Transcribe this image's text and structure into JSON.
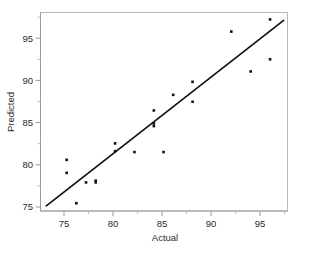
{
  "chart_data": {
    "type": "scatter",
    "title": "",
    "subtitle": "",
    "xlabel": "Actual",
    "ylabel": "Predicted",
    "xlim": [
      72.3,
      97.8
    ],
    "ylim": [
      74.4,
      97.3
    ],
    "xticks": [
      75,
      80,
      85,
      90,
      95
    ],
    "xtick_labels": [
      "75",
      "80",
      "85",
      "90",
      "95"
    ],
    "yticks": [
      75,
      80,
      85,
      90,
      95
    ],
    "ytick_labels": [
      "75",
      "80",
      "85",
      "90",
      "95"
    ],
    "grid": false,
    "legend": false,
    "legend_position": "none",
    "marker": "square",
    "marker_color": "#111111",
    "marker_size_px": 2.6,
    "series": [
      {
        "name": "Predicted vs Actual",
        "x": [
          75.0,
          75.0,
          76.0,
          77.0,
          78.0,
          78.0,
          80.0,
          80.0,
          82.0,
          84.0,
          84.0,
          84.0,
          85.0,
          86.0,
          88.0,
          88.0,
          92.0,
          94.0,
          96.0,
          96.0
        ],
        "y": [
          80.3,
          78.8,
          75.3,
          77.7,
          77.7,
          77.9,
          82.2,
          81.3,
          81.2,
          84.2,
          84.5,
          86.0,
          81.2,
          87.8,
          89.3,
          87.0,
          95.1,
          90.5,
          96.5,
          91.9
        ]
      }
    ],
    "fit_line": {
      "name": "regression-line",
      "x": [
        72.9,
        97.4
      ],
      "y": [
        75.0,
        96.4
      ],
      "color": "#111111"
    }
  },
  "axes": {
    "x_axis_label": "Actual",
    "y_axis_label": "Predicted"
  }
}
